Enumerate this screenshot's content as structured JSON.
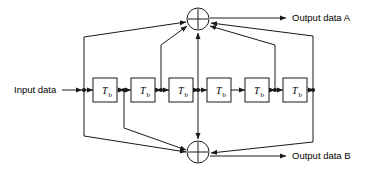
{
  "diagram": {
    "title_text": "",
    "background_color": "#ffffff",
    "line_color": "#1a1a1a",
    "block_fill": "#ffffff",
    "labels": {
      "input": "Input data",
      "output_a": "Output data A",
      "output_b": "Output data B"
    },
    "delay_blocks": [
      {
        "main": "T",
        "sub": "b"
      },
      {
        "main": "T",
        "sub": "b"
      },
      {
        "main": "T",
        "sub": "b"
      },
      {
        "main": "T",
        "sub": "b"
      },
      {
        "main": "T",
        "sub": "b"
      },
      {
        "main": "T",
        "sub": "b"
      }
    ],
    "adders": [
      {
        "symbol": "+",
        "name": "top-adder"
      },
      {
        "symbol": "+",
        "name": "bottom-adder"
      }
    ],
    "tap_count": 6,
    "delay_count": 6
  }
}
